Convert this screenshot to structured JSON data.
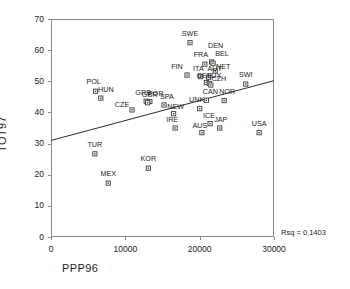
{
  "chart_data": {
    "type": "scatter",
    "title": "",
    "xlabel": "PPP96",
    "ylabel": "TOT97",
    "xlim": [
      0,
      30000
    ],
    "ylim": [
      0,
      70
    ],
    "xticks": [
      0,
      10000,
      20000,
      30000
    ],
    "xtick_labels": [
      "0",
      "10000",
      "20000",
      "30000"
    ],
    "yticks": [
      0,
      10,
      20,
      30,
      40,
      50,
      60,
      70
    ],
    "ytick_labels": [
      "0",
      "10",
      "20",
      "30",
      "40",
      "50",
      "60",
      "70"
    ],
    "grid": false,
    "legend": "none",
    "annotation": "Rsq = 0,1403",
    "rsq": 0.1403,
    "marker_style": "open-square",
    "regression_line": {
      "x": [
        0,
        30000
      ],
      "y": [
        31.0,
        50.2
      ],
      "intercept": 31.0,
      "slope_per_10000": 6.4
    },
    "points": [
      {
        "label": "SWE",
        "x": 18700,
        "y": 62.4,
        "lx": 0,
        "ly": -7
      },
      {
        "label": "DEN",
        "x": 21600,
        "y": 56.2,
        "lx": 4,
        "ly": -14
      },
      {
        "label": "FRA",
        "x": 20700,
        "y": 55.5,
        "lx": -4,
        "ly": -7
      },
      {
        "label": "BEL",
        "x": 21800,
        "y": 55.8,
        "lx": 9,
        "ly": -7
      },
      {
        "label": "NET",
        "x": 22100,
        "y": 53.3,
        "lx": 8,
        "ly": -2
      },
      {
        "label": "FIN",
        "x": 18300,
        "y": 52.0,
        "lx": -10,
        "ly": -6
      },
      {
        "label": "ITA",
        "x": 20100,
        "y": 51.5,
        "lx": -2,
        "ly": -6
      },
      {
        "label": "AUT",
        "x": 21200,
        "y": 51.3,
        "lx": 6,
        "ly": -6
      },
      {
        "label": "GER",
        "x": 20900,
        "y": 49.6,
        "lx": -2,
        "ly": -5
      },
      {
        "label": "LUX",
        "x": 21300,
        "y": 49.3,
        "lx": 5,
        "ly": -5
      },
      {
        "label": "CZH",
        "x": 21500,
        "y": 48.8,
        "lx": 8,
        "ly": -4
      },
      {
        "label": "SWI",
        "x": 26200,
        "y": 49.1,
        "lx": 0,
        "ly": -7
      },
      {
        "label": "POL",
        "x": 6000,
        "y": 46.8,
        "lx": -2,
        "ly": -7
      },
      {
        "label": "HUN",
        "x": 6700,
        "y": 44.6,
        "lx": 5,
        "ly": -6
      },
      {
        "label": "NOR",
        "x": 23300,
        "y": 43.8,
        "lx": 3,
        "ly": -7
      },
      {
        "label": "UNK",
        "x": 20000,
        "y": 41.2,
        "lx": -3,
        "ly": -7
      },
      {
        "label": "CAN",
        "x": 20900,
        "y": 43.9,
        "lx": 4,
        "ly": -6
      },
      {
        "label": "GRE",
        "x": 12800,
        "y": 43.6,
        "lx": -3,
        "ly": -6
      },
      {
        "label": "POR",
        "x": 13300,
        "y": 43.5,
        "lx": 6,
        "ly": -6
      },
      {
        "label": "GBR",
        "x": 13000,
        "y": 43.1,
        "lx": 2,
        "ly": -6
      },
      {
        "label": "SPA",
        "x": 15200,
        "y": 42.4,
        "lx": 3,
        "ly": -6
      },
      {
        "label": "CZE",
        "x": 10900,
        "y": 40.8,
        "lx": -10,
        "ly": -3
      },
      {
        "label": "NEW",
        "x": 16500,
        "y": 39.6,
        "lx": 2,
        "ly": -5
      },
      {
        "label": "IRE",
        "x": 16700,
        "y": 35.0,
        "lx": -3,
        "ly": -6
      },
      {
        "label": "ICE",
        "x": 21400,
        "y": 36.4,
        "lx": -1,
        "ly": -6
      },
      {
        "label": "JAP",
        "x": 22700,
        "y": 35.0,
        "lx": 1,
        "ly": -6
      },
      {
        "label": "AUS",
        "x": 20300,
        "y": 33.5,
        "lx": -2,
        "ly": -5
      },
      {
        "label": "USA",
        "x": 28000,
        "y": 33.5,
        "lx": 0,
        "ly": -7
      },
      {
        "label": "TUR",
        "x": 5900,
        "y": 26.7,
        "lx": 0,
        "ly": -7
      },
      {
        "label": "KOR",
        "x": 13100,
        "y": 22.1,
        "lx": 0,
        "ly": -7
      },
      {
        "label": "MEX",
        "x": 7700,
        "y": 17.3,
        "lx": 0,
        "ly": -7
      }
    ]
  }
}
